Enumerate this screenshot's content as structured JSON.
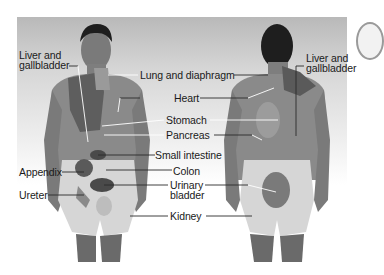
{
  "diagram": {
    "title": "",
    "views": [
      "front",
      "back"
    ],
    "colors": {
      "background_top": "#b9b9b9",
      "skin_dark": "#6e6e6e",
      "skin_mid": "#8a8a8a",
      "pain_zone": "#d9d9d9",
      "organ_shade": "#4a4a4a",
      "leader_line": "#2a2a2a",
      "hair": "#1e1e1e"
    },
    "labels": {
      "liver_front_line1": "Liver and",
      "liver_front_line2": "gallbladder",
      "lung": "Lung and diaphragm",
      "heart": "Heart",
      "stomach": "Stomach",
      "pancreas": "Pancreas",
      "small_intestine": "Small intestine",
      "appendix": "Appendix",
      "colon": "Colon",
      "ureter": "Ureter",
      "urinary_line1": "Urinary",
      "urinary_line2": "bladder",
      "kidney": "Kidney",
      "liver_back_line1": "Liver and",
      "liver_back_line2": "gallbladder"
    }
  }
}
